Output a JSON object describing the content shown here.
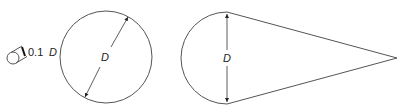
{
  "diagram": {
    "small_cylinder": {
      "label_number": "0.1",
      "label_var": "D"
    },
    "circle": {
      "label": "D"
    },
    "teardrop": {
      "label": "D"
    },
    "colors": {
      "stroke": "#555555",
      "text": "#222222"
    }
  }
}
